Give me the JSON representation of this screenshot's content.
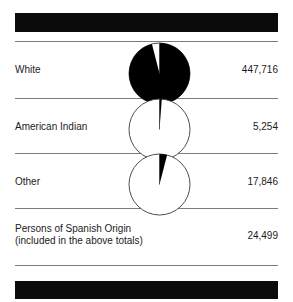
{
  "chart_data": {
    "type": "pie",
    "title": "",
    "subtitle": "",
    "xlabel": "",
    "ylabel": "",
    "legend_position": "none",
    "grid": false,
    "note": "Three proportional pie charts, one per population category. Each pie's filled (black) fraction shows that category's share of the whole circle; the remainder is white. The pies are drawn at a common radius and each rendered starting at 12 o'clock.",
    "categories": [
      "White",
      "American Indian",
      "Other"
    ],
    "values": [
      447716,
      5254,
      17846
    ],
    "annotations": [
      {
        "label": "Persons of Spanish Origin (included in the above totals)",
        "value": 24499
      }
    ],
    "slices": [
      {
        "label": "White",
        "value": 447716,
        "filled_fraction": 0.96,
        "fill": "#000000"
      },
      {
        "label": "American Indian",
        "value": 5254,
        "filled_fraction": 0.012,
        "fill": "#000000"
      },
      {
        "label": "Other",
        "value": 17846,
        "filled_fraction": 0.04,
        "fill": "#000000"
      }
    ]
  },
  "bars": {
    "top_bar_color": "#0b0b0b",
    "bottom_bar_color": "#0b0b0b"
  },
  "rows": [
    {
      "label": "White",
      "label_line2": "",
      "value": "447,716"
    },
    {
      "label": "American Indian",
      "label_line2": "",
      "value": "5,254"
    },
    {
      "label": "Other",
      "label_line2": "",
      "value": "17,846"
    },
    {
      "label": "Persons of Spanish Origin",
      "label_line2": "(included in the above totals)",
      "value": "24,499"
    }
  ],
  "colors": {
    "rule": "#7c7c7c",
    "text": "#1b1b1b",
    "pie_fill": "#000000",
    "pie_stroke": "#3a3a3a",
    "background": "#ffffff"
  }
}
